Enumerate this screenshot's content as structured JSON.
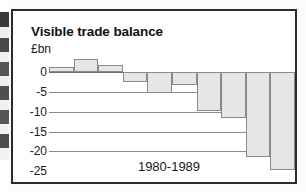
{
  "figure": {
    "title": "Visible trade balance",
    "unit_label": "£bn",
    "x_axis_caption": "1980-1989",
    "frame_color": "#2b2b2b",
    "bar_fill_color": "#e6e6e4",
    "bar_edge_color": "#8a8a8a",
    "gridline_color": "#8c8c8c"
  },
  "chart_data": {
    "type": "bar",
    "title": "Visible trade balance",
    "subtitle": "",
    "xlabel": "1980-1989",
    "ylabel": "£bn",
    "categories": [
      "1980",
      "1981",
      "1982",
      "1983",
      "1984",
      "1985",
      "1986",
      "1987",
      "1988",
      "1989"
    ],
    "values": [
      1.3,
      3.2,
      1.8,
      -2.5,
      -5.3,
      -3.3,
      -9.8,
      -11.5,
      -21.5,
      -24.7
    ],
    "ylim": [
      -25,
      5
    ],
    "yticks": [
      0,
      -5,
      -10,
      -15,
      -20,
      -25
    ],
    "ytick_labels": [
      "0",
      "-5",
      "-10",
      "-15",
      "-20",
      "-25"
    ],
    "grid": true,
    "legend": "none",
    "units": "£bn"
  }
}
